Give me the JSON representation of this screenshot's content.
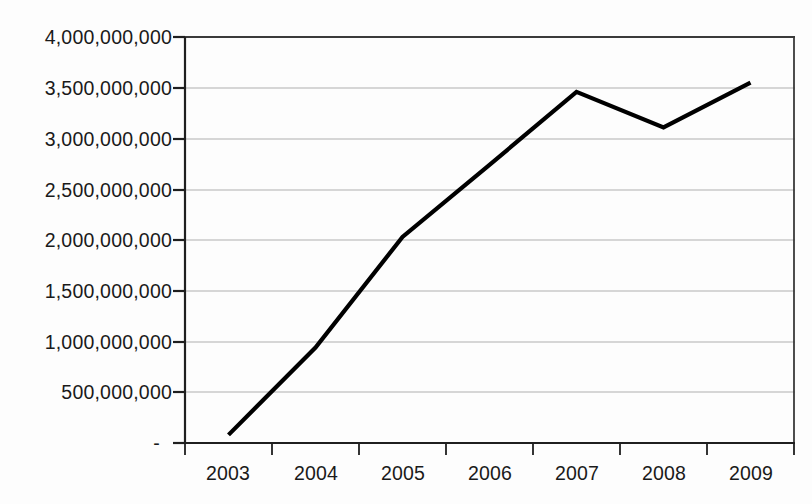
{
  "chart_data": {
    "type": "line",
    "title": "",
    "subtitle": "",
    "xlabel": "",
    "ylabel": "",
    "categories": [
      "2003",
      "2004",
      "2005",
      "2006",
      "2007",
      "2008",
      "2009"
    ],
    "values": [
      80000000,
      940000000,
      2030000000,
      2740000000,
      3460000000,
      3110000000,
      3550000000
    ],
    "series": [
      {
        "name": "",
        "values": [
          80000000,
          940000000,
          2030000000,
          2740000000,
          3460000000,
          3110000000,
          3550000000
        ]
      }
    ],
    "ylim": [
      0,
      4000000000
    ],
    "ytick_values": [
      0,
      500000000,
      1000000000,
      1500000000,
      2000000000,
      2500000000,
      3000000000,
      3500000000,
      4000000000
    ],
    "ytick_labels": [
      "-",
      "500,000,000",
      "1,000,000,000",
      "1,500,000,000",
      "2,000,000,000",
      "2,500,000,000",
      "3,000,000,000",
      "3,500,000,000",
      "4,000,000,000"
    ],
    "xtick_labels": [
      "2003",
      "2004",
      "2005",
      "2006",
      "2007",
      "2008",
      "2009"
    ],
    "grid": "horizontal",
    "legend": "none",
    "line_color": "#000000",
    "grid_color": "#c8c8c8",
    "axis_color": "#2b2b2b",
    "background_color": "#fdfdfd"
  },
  "footer": {
    "ghost_text": ""
  }
}
